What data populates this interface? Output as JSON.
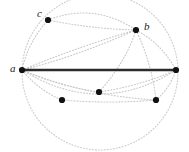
{
  "figure": {
    "width": 189,
    "height": 152,
    "background_color": "#ffffff"
  },
  "style": {
    "point_color": "#111111",
    "point_radius": 3.1,
    "solid_edge_color": "#2b2b2b",
    "solid_edge_width": 2.6,
    "dotted_color": "#c9c9c9",
    "dotted_circle_color": "#cccccc",
    "dotted_width": 1.1,
    "dash_pattern": "1,2",
    "label_color": "#1a1a1a"
  },
  "circle": {
    "name": "enclosing-dotted-circle",
    "cx": 100,
    "cy": 72,
    "r": 78
  },
  "points": [
    {
      "id": "a",
      "label": "a",
      "x": 22,
      "y": 70,
      "labeled": true,
      "label_x": 10,
      "label_y": 63
    },
    {
      "id": "b",
      "label": "b",
      "x": 136,
      "y": 30,
      "labeled": true,
      "label_x": 144,
      "label_y": 21
    },
    {
      "id": "c",
      "label": "c",
      "x": 48,
      "y": 20,
      "labeled": true,
      "label_x": 37,
      "label_y": 8
    },
    {
      "id": "p1",
      "label": "",
      "x": 176,
      "y": 70,
      "labeled": false,
      "label_x": 0,
      "label_y": 0
    },
    {
      "id": "p2",
      "label": "",
      "x": 99,
      "y": 92,
      "labeled": false,
      "label_x": 0,
      "label_y": 0
    },
    {
      "id": "p3",
      "label": "",
      "x": 62,
      "y": 100,
      "labeled": false,
      "label_x": 0,
      "label_y": 0
    },
    {
      "id": "p4",
      "label": "",
      "x": 156,
      "y": 100,
      "labeled": false,
      "label_x": 0,
      "label_y": 0
    }
  ],
  "solid_edges": [
    {
      "name": "chord-a-to-p1",
      "from": "a",
      "to": "p1"
    }
  ],
  "dotted_arcs": [
    {
      "name": "arc-a-to-c",
      "x1": 22,
      "y1": 70,
      "x2": 48,
      "y2": 20,
      "cx": 28,
      "cy": 42
    },
    {
      "name": "arc-c-to-b",
      "x1": 48,
      "y1": 20,
      "x2": 136,
      "y2": 30,
      "cx": 92,
      "cy": 29
    },
    {
      "name": "arc-c-top-b",
      "x1": 48,
      "y1": 20,
      "x2": 136,
      "y2": 30,
      "cx": 94,
      "cy": 2
    },
    {
      "name": "arc-a-to-b",
      "x1": 22,
      "y1": 70,
      "x2": 136,
      "y2": 30,
      "cx": 80,
      "cy": 46
    },
    {
      "name": "arc-b-to-p1",
      "x1": 136,
      "y1": 30,
      "x2": 176,
      "y2": 70,
      "cx": 162,
      "cy": 44
    },
    {
      "name": "arc-a-to-p2",
      "x1": 22,
      "y1": 70,
      "x2": 99,
      "y2": 92,
      "cx": 58,
      "cy": 86
    },
    {
      "name": "arc-p2-to-p1",
      "x1": 99,
      "y1": 92,
      "x2": 176,
      "y2": 70,
      "cx": 140,
      "cy": 86
    },
    {
      "name": "arc-a-to-p3",
      "x1": 22,
      "y1": 70,
      "x2": 62,
      "y2": 100,
      "cx": 38,
      "cy": 90
    },
    {
      "name": "arc-p3-to-p4",
      "x1": 62,
      "y1": 100,
      "x2": 156,
      "y2": 100,
      "cx": 109,
      "cy": 104
    },
    {
      "name": "arc-p4-to-p1",
      "x1": 156,
      "y1": 100,
      "x2": 176,
      "y2": 70,
      "cx": 170,
      "cy": 88
    },
    {
      "name": "arc-a-to-p4",
      "x1": 22,
      "y1": 70,
      "x2": 156,
      "y2": 100,
      "cx": 86,
      "cy": 96
    },
    {
      "name": "arc-a-low",
      "x1": 22,
      "y1": 70,
      "x2": 176,
      "y2": 70,
      "cx": 100,
      "cy": 118
    },
    {
      "name": "arc-a-to-b2",
      "x1": 22,
      "y1": 70,
      "x2": 136,
      "y2": 30,
      "cx": 72,
      "cy": 58
    },
    {
      "name": "arc-b-to-p4",
      "x1": 136,
      "y1": 30,
      "x2": 156,
      "y2": 100,
      "cx": 152,
      "cy": 64
    },
    {
      "name": "arc-b-to-p2",
      "x1": 136,
      "y1": 30,
      "x2": 99,
      "y2": 92,
      "cx": 126,
      "cy": 62
    }
  ]
}
